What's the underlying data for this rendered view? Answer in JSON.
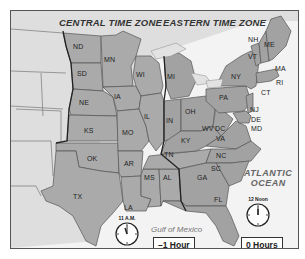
{
  "map": {
    "zones": [
      {
        "name": "CENTRAL TIME ZONE",
        "offset_label": "–1 Hour",
        "clock_label": "11 A.M.",
        "clock_hour": 11,
        "clock_minute": 0
      },
      {
        "name": "EASTERN TIME ZONE",
        "offset_label": "0 Hours",
        "clock_label": "12 Noon",
        "clock_hour": 12,
        "clock_minute": 0
      }
    ],
    "water_labels": {
      "ocean": "ATLANTIC OCEAN",
      "ocean_line1": "ATLANTIC",
      "ocean_line2": "OCEAN",
      "gulf": "Gulf of Mexico"
    },
    "states": {
      "ND": "ND",
      "SD": "SD",
      "NE": "NE",
      "KS": "KS",
      "OK": "OK",
      "TX": "TX",
      "MN": "MN",
      "IA": "IA",
      "MO": "MO",
      "AR": "AR",
      "LA": "LA",
      "WI": "WI",
      "IL": "IL",
      "MS": "MS",
      "AL": "AL",
      "TN": "TN",
      "MI": "MI",
      "IN": "IN",
      "OH": "OH",
      "KY": "KY",
      "GA": "GA",
      "FL": "FL",
      "WV": "WV",
      "VA": "VA",
      "DC": "DC",
      "NC": "NC",
      "SC": "SC",
      "PA": "PA",
      "NY": "NY",
      "NJ": "NJ",
      "DE": "DE",
      "MD": "MD",
      "CT": "CT",
      "RI": "RI",
      "MA": "MA",
      "VT": "VT",
      "NH": "NH",
      "ME": "ME"
    },
    "colors": {
      "central_fill": "#a9a9a9",
      "eastern_fill": "#a3a3a3",
      "other_land": "#dcdcdc",
      "water": "#f4f4f4",
      "border": "#555555",
      "zone_line": "#222222"
    }
  }
}
